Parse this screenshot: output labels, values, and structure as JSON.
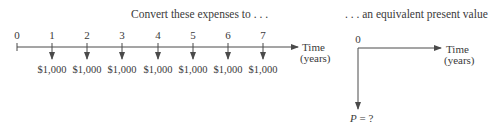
{
  "left_diagram": {
    "caption": "Convert these expenses to . . .",
    "periods": [
      "0",
      "1",
      "2",
      "3",
      "4",
      "5",
      "6",
      "7"
    ],
    "amounts": [
      "$1,000",
      "$1,000",
      "$1,000",
      "$1,000",
      "$1,000",
      "$1,000",
      "$1,000"
    ],
    "axis_label_line1": "Time",
    "axis_label_line2": "(years)"
  },
  "right_diagram": {
    "caption": ". . . an equivalent present value",
    "period": "0",
    "axis_label_line1": "Time",
    "axis_label_line2": "(years)",
    "present_value_label_var": "P",
    "present_value_label_rest": " = ?"
  },
  "colors": {
    "line": "#4a4a4a",
    "text": "#3a3a3a"
  }
}
